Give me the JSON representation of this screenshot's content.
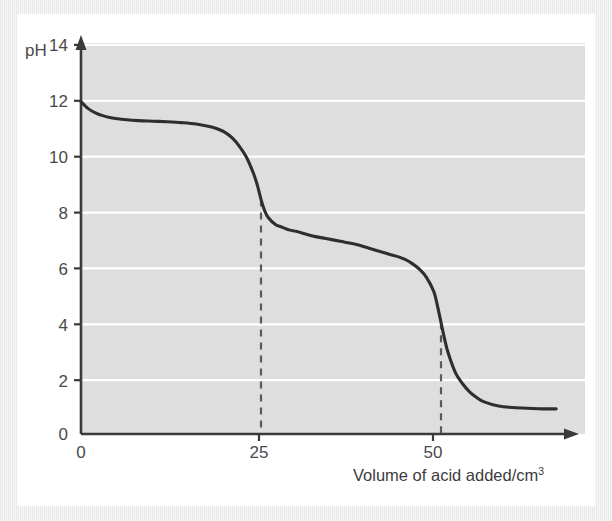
{
  "figure": {
    "background_color": "#ffffff",
    "frame_color": "#ececec",
    "plot_area_color": "#dedede",
    "gridline_color": "#ffffff",
    "axis_color": "#3a3a3a",
    "curve_color": "#2e2e2e",
    "dashed_line_color": "#5a5a5a"
  },
  "chart_data": {
    "type": "line",
    "title": "",
    "subtitle": "",
    "xlabel": "Volume of acid added/cm",
    "xlabel_superscript": "3",
    "xlabel_full": "Volume of acid added/cm3",
    "ylabel": "pH",
    "xlim": [
      0,
      70
    ],
    "ylim": [
      0,
      14
    ],
    "xticks": [
      0,
      25,
      50
    ],
    "xtick_labels": [
      "0",
      "25",
      "50"
    ],
    "yticks": [
      0,
      2,
      4,
      6,
      8,
      10,
      12,
      14
    ],
    "ytick_labels": [
      "0",
      "2",
      "4",
      "6",
      "8",
      "10",
      "12",
      "14"
    ],
    "grid": "horizontal-only",
    "gridlines_y": [
      2,
      4,
      6,
      8,
      10,
      12,
      14
    ],
    "legend": "none",
    "legend_position": "none",
    "x_axis_arrow": true,
    "y_axis_arrow": true,
    "series": [
      {
        "name": "pH titration curve",
        "x": [
          0,
          1,
          2,
          3,
          4,
          5,
          6,
          8,
          10,
          12,
          14,
          16,
          18,
          19,
          20,
          21,
          22,
          23,
          24,
          24.5,
          25,
          25.5,
          26,
          27,
          28,
          29,
          30,
          32,
          34,
          36,
          38,
          40,
          42,
          43,
          44,
          45,
          46,
          47,
          48,
          49,
          49.5,
          50,
          50.5,
          51,
          52,
          53,
          54,
          55,
          56,
          58,
          60,
          62,
          64,
          66
        ],
        "y": [
          11.9,
          11.65,
          11.5,
          11.4,
          11.33,
          11.29,
          11.26,
          11.22,
          11.2,
          11.18,
          11.15,
          11.1,
          11.0,
          10.92,
          10.8,
          10.6,
          10.3,
          9.9,
          9.3,
          8.9,
          8.4,
          8.0,
          7.75,
          7.5,
          7.4,
          7.3,
          7.25,
          7.1,
          7.0,
          6.9,
          6.8,
          6.65,
          6.5,
          6.42,
          6.35,
          6.25,
          6.1,
          5.9,
          5.6,
          5.1,
          4.6,
          4.0,
          3.4,
          2.9,
          2.2,
          1.8,
          1.5,
          1.3,
          1.15,
          1.0,
          0.95,
          0.92,
          0.9,
          0.9
        ]
      }
    ],
    "annotations": [
      {
        "name": "first-equivalence-dashed-line",
        "type": "vertical-dashed-line",
        "x": 25,
        "y_from": 0,
        "y_to": 8.4,
        "label": ""
      },
      {
        "name": "second-equivalence-dashed-line",
        "type": "vertical-dashed-line",
        "x": 50,
        "y_from": 0,
        "y_to": 4.0,
        "label": ""
      }
    ]
  },
  "labels": {
    "y_axis_title": "pH",
    "y_ticks": [
      {
        "value": 14,
        "text": "14"
      },
      {
        "value": 12,
        "text": "12"
      },
      {
        "value": 10,
        "text": "10"
      },
      {
        "value": 8,
        "text": "8"
      },
      {
        "value": 6,
        "text": "6"
      },
      {
        "value": 4,
        "text": "4"
      },
      {
        "value": 2,
        "text": "2"
      },
      {
        "value": 0,
        "text": "0"
      }
    ],
    "x_ticks": [
      {
        "value": 0,
        "text": "0"
      },
      {
        "value": 25,
        "text": "25"
      },
      {
        "value": 50,
        "text": "50"
      }
    ],
    "x_axis_title_main": "Volume of acid added/cm",
    "x_axis_title_superscript": "3"
  }
}
